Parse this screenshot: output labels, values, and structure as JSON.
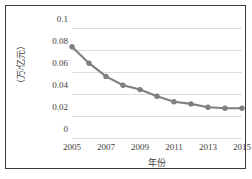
{
  "chart_data": {
    "type": "line",
    "title": "",
    "xlabel": "年份",
    "ylabel": "（万/亿元）",
    "categories": [
      2005,
      2006,
      2007,
      2008,
      2009,
      2010,
      2011,
      2012,
      2013,
      2014,
      2015
    ],
    "x_tick_labels": [
      "2005",
      "2007",
      "2009",
      "2011",
      "2013",
      "2015"
    ],
    "x_tick_values": [
      2005,
      2007,
      2009,
      2011,
      2013,
      2015
    ],
    "y_tick_labels": [
      "0",
      "0.02",
      "0.04",
      "0.06",
      "0.08",
      "0.1"
    ],
    "y_tick_values": [
      0,
      0.02,
      0.04,
      0.06,
      0.08,
      0.1
    ],
    "values": [
      0.083,
      0.068,
      0.056,
      0.048,
      0.044,
      0.038,
      0.033,
      0.031,
      0.028,
      0.027,
      0.027
    ],
    "series": [
      {
        "name": "",
        "values": [
          0.083,
          0.068,
          0.056,
          0.048,
          0.044,
          0.038,
          0.033,
          0.031,
          0.028,
          0.027,
          0.027
        ]
      }
    ],
    "xlim": [
      2005,
      2015
    ],
    "ylim": [
      0,
      0.1
    ],
    "grid": "horizontal",
    "legend": "none",
    "line_color": "#808080",
    "marker_color": "#7f7f7f",
    "marker": "circle",
    "gridline_color": "#dcdcdc",
    "frame_color": "#3a3a3a",
    "background_color": "#ffffff"
  }
}
